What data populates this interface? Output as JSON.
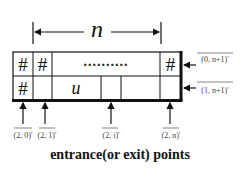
{
  "diagram": {
    "width_label": "n",
    "grid": {
      "top_row": [
        "#",
        "#",
        "..........",
        "#"
      ],
      "bottom_row": [
        "#",
        "",
        "u",
        "",
        "",
        ""
      ]
    },
    "right_labels": [
      "(0, n+1)'",
      "(1, n+1)'"
    ],
    "bottom_labels": [
      "(2, 0)'",
      "(2, 1)'",
      "(2, i)'",
      "(2, n)'"
    ],
    "caption": "entrance(or exit) points"
  }
}
